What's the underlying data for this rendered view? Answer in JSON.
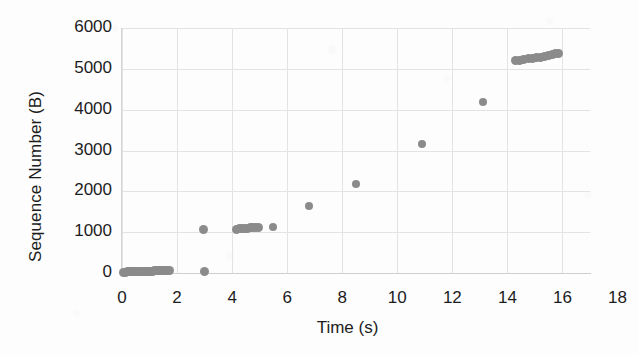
{
  "chart_data": {
    "type": "scatter",
    "title": "",
    "xlabel": "Time (s)",
    "ylabel": "Sequence Number (B)",
    "xlim": [
      0,
      17
    ],
    "ylim": [
      0,
      6000
    ],
    "xticks": [
      0,
      2,
      4,
      6,
      8,
      10,
      12,
      14,
      16,
      18
    ],
    "yticks": [
      0,
      1000,
      2000,
      3000,
      4000,
      5000,
      6000
    ],
    "xtick_labels": [
      "0",
      "2",
      "4",
      "6",
      "8",
      "10",
      "12",
      "14",
      "16",
      "18"
    ],
    "ytick_labels": [
      "0",
      "1000",
      "2000",
      "3000",
      "4000",
      "5000",
      "6000"
    ],
    "grid": true,
    "legend": false,
    "marker_color": "#8b8b8b",
    "marker_shape": "circle",
    "series": [
      {
        "name": "Sequence Number",
        "points": [
          [
            0.05,
            20
          ],
          [
            0.12,
            20
          ],
          [
            0.19,
            25
          ],
          [
            0.26,
            25
          ],
          [
            0.33,
            30
          ],
          [
            0.4,
            30
          ],
          [
            0.47,
            30
          ],
          [
            0.54,
            35
          ],
          [
            0.61,
            35
          ],
          [
            0.68,
            35
          ],
          [
            0.75,
            40
          ],
          [
            0.82,
            40
          ],
          [
            0.89,
            40
          ],
          [
            0.96,
            45
          ],
          [
            1.03,
            45
          ],
          [
            1.1,
            45
          ],
          [
            1.17,
            50
          ],
          [
            1.24,
            50
          ],
          [
            1.31,
            50
          ],
          [
            1.38,
            55
          ],
          [
            1.45,
            55
          ],
          [
            1.52,
            55
          ],
          [
            1.59,
            60
          ],
          [
            1.66,
            60
          ],
          [
            1.72,
            60
          ],
          [
            2.98,
            30
          ],
          [
            2.97,
            1055
          ],
          [
            4.15,
            1075
          ],
          [
            4.25,
            1085
          ],
          [
            4.35,
            1090
          ],
          [
            4.45,
            1095
          ],
          [
            4.55,
            1100
          ],
          [
            4.65,
            1105
          ],
          [
            4.75,
            1110
          ],
          [
            4.85,
            1115
          ],
          [
            4.95,
            1120
          ],
          [
            5.5,
            1135
          ],
          [
            6.8,
            1650
          ],
          [
            8.5,
            2180
          ],
          [
            10.9,
            3170
          ],
          [
            13.1,
            4200
          ],
          [
            14.3,
            5200
          ],
          [
            14.45,
            5215
          ],
          [
            14.6,
            5230
          ],
          [
            14.75,
            5245
          ],
          [
            14.9,
            5258
          ],
          [
            15.05,
            5272
          ],
          [
            15.2,
            5288
          ],
          [
            15.35,
            5305
          ],
          [
            15.5,
            5325
          ],
          [
            15.62,
            5345
          ],
          [
            15.75,
            5365
          ],
          [
            15.85,
            5385
          ]
        ]
      }
    ]
  }
}
